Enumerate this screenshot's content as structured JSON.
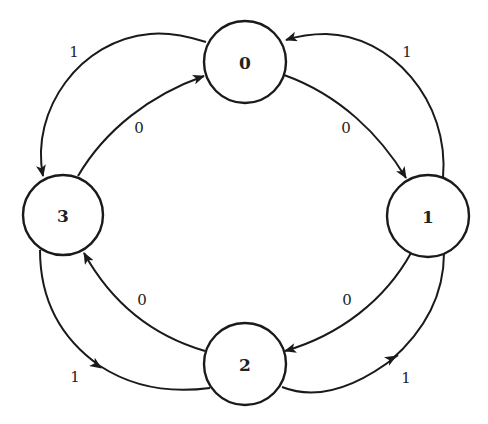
{
  "diagram": {
    "type": "state-transition-diagram",
    "nodes": [
      {
        "id": "0",
        "label": "0",
        "cx": 245,
        "cy": 62,
        "r": 41
      },
      {
        "id": "1",
        "label": "1",
        "cx": 428,
        "cy": 216,
        "r": 41
      },
      {
        "id": "2",
        "label": "2",
        "cx": 245,
        "cy": 364,
        "r": 41
      },
      {
        "id": "3",
        "label": "3",
        "cx": 63,
        "cy": 215,
        "r": 40
      }
    ],
    "edges": [
      {
        "from": "0",
        "to": "1",
        "label": "0"
      },
      {
        "from": "1",
        "to": "0",
        "label": "1"
      },
      {
        "from": "1",
        "to": "2",
        "label": "0"
      },
      {
        "from": "2",
        "to": "1",
        "label": "1"
      },
      {
        "from": "2",
        "to": "3",
        "label": "0"
      },
      {
        "from": "3",
        "to": "2",
        "label": "1"
      },
      {
        "from": "3",
        "to": "0",
        "label": "0"
      },
      {
        "from": "0",
        "to": "3",
        "label": "1"
      }
    ],
    "colors": {
      "stroke": "#1a1a1a",
      "background": "#ffffff"
    }
  }
}
